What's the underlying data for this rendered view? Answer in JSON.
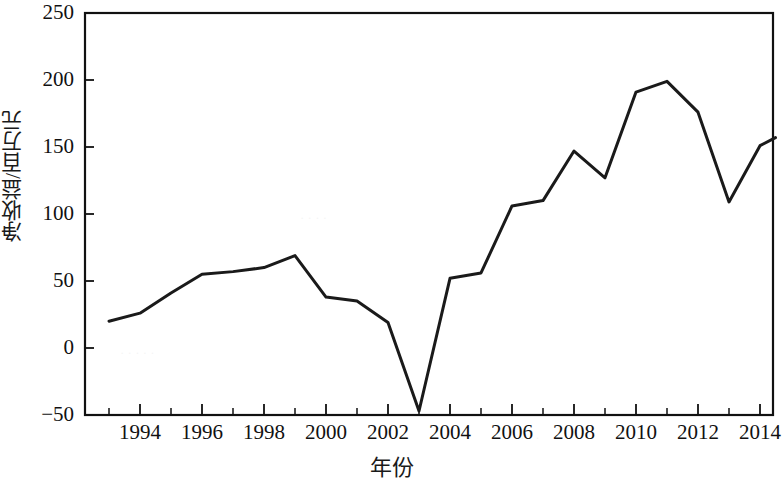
{
  "chart_data": {
    "type": "line",
    "title": "",
    "xlabel": "年份",
    "ylabel": "净收益/百万元",
    "xlim": [
      1993,
      2014.6
    ],
    "ylim": [
      -60,
      250
    ],
    "grid": false,
    "legend": null,
    "x_ticks": [
      1994,
      1996,
      1998,
      2000,
      2002,
      2004,
      2006,
      2008,
      2010,
      2012,
      2014
    ],
    "x_tick_labels": [
      "1994",
      "1996",
      "1998",
      "2000",
      "2002",
      "2004",
      "2006",
      "2008",
      "2010",
      "2012",
      "2014"
    ],
    "x_minor_ticks": [
      1993,
      1995,
      1997,
      1999,
      2001,
      2003,
      2005,
      2007,
      2009,
      2011,
      2013
    ],
    "y_ticks": [
      -50,
      0,
      50,
      100,
      150,
      200,
      250
    ],
    "y_tick_labels": [
      "−50",
      "0",
      "50",
      "100",
      "150",
      "200",
      "250"
    ],
    "series": [
      {
        "name": "净收益",
        "color": "#1a1a1a",
        "x": [
          1993,
          1994,
          1995,
          1996,
          1997,
          1998,
          1999,
          2000,
          2001,
          2002,
          2003,
          2004,
          2005,
          2006,
          2007,
          2008,
          2009,
          2010,
          2011,
          2012,
          2013,
          2014,
          2014.5
        ],
        "values": [
          20,
          26,
          41,
          55,
          57,
          60,
          69,
          38,
          35,
          19,
          -47,
          52,
          56,
          106,
          110,
          147,
          127,
          191,
          199,
          176,
          109,
          151,
          157
        ]
      }
    ]
  },
  "axes": {
    "y_label_text": "净收益/百万元",
    "x_label_text": "年份"
  }
}
